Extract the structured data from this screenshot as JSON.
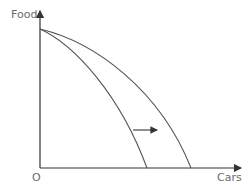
{
  "diagram": {
    "type": "production-possibility-frontier",
    "y_axis_label": "Food",
    "x_axis_label": "Cars",
    "origin_label": "O",
    "curves": [
      {
        "name": "original-ppf",
        "description": "inner frontier"
      },
      {
        "name": "shifted-ppf",
        "description": "outer frontier (shifted right along Cars axis)"
      }
    ],
    "annotation": "arrow pointing right indicating outward shift of frontier",
    "colors": {
      "axis": "#333333",
      "curve": "#555555",
      "label": "#6b6b6b"
    }
  }
}
